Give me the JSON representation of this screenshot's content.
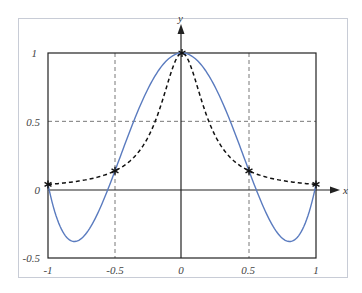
{
  "chart_data": {
    "type": "line",
    "title": "",
    "xlabel": "x",
    "ylabel": "y",
    "xlim": [
      -1,
      1
    ],
    "ylim": [
      -0.5,
      1
    ],
    "grid": true,
    "x_ticks": [
      "-1",
      "-0.5",
      "0",
      "0.5",
      "1"
    ],
    "y_ticks": [
      "-0.5",
      "0",
      "0.5",
      "1"
    ],
    "series": [
      {
        "name": "f(x) = 1/(1+25x^2)",
        "style": "dashed",
        "color": "#111111",
        "x": [
          -1,
          -0.75,
          -0.5,
          -0.25,
          0,
          0.25,
          0.5,
          0.75,
          1
        ],
        "values": [
          0.038,
          0.066,
          0.138,
          0.39,
          1.0,
          0.39,
          0.138,
          0.066,
          0.038
        ]
      },
      {
        "name": "Interpolating polynomial P4(x)",
        "style": "solid",
        "color": "#5a7bbf",
        "x": [
          -1,
          -0.8,
          -0.5,
          -0.25,
          0,
          0.25,
          0.5,
          0.8,
          1
        ],
        "values": [
          0.038,
          -0.38,
          0.138,
          0.745,
          1.0,
          0.745,
          0.138,
          -0.38,
          0.038
        ]
      }
    ],
    "markers": {
      "symbol": "asterisk",
      "points": [
        [
          -1,
          0.038
        ],
        [
          -0.5,
          0.138
        ],
        [
          0,
          1.0
        ],
        [
          0.5,
          0.138
        ],
        [
          1,
          0.038
        ]
      ]
    }
  },
  "labels": {
    "x_axis": "x",
    "y_axis": "y",
    "xt": [
      "-1",
      "-0.5",
      "0",
      "0.5",
      "1"
    ],
    "yt": [
      "1",
      "0.5",
      "0",
      "-0.5"
    ]
  }
}
